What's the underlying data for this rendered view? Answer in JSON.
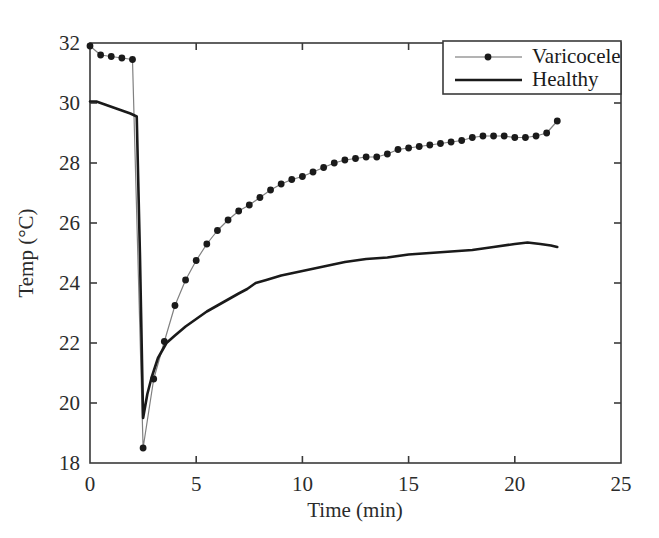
{
  "chart_data": {
    "type": "line",
    "title": "",
    "xlabel": "Time (min)",
    "ylabel": "Temp (°C)",
    "xlim": [
      0,
      25
    ],
    "ylim": [
      18,
      32
    ],
    "xticks": [
      0,
      5,
      10,
      15,
      20,
      25
    ],
    "yticks": [
      18,
      20,
      22,
      24,
      26,
      28,
      30,
      32
    ],
    "xtick_labels": [
      "0",
      "5",
      "10",
      "15",
      "20",
      "25"
    ],
    "ytick_labels": [
      "18",
      "20",
      "22",
      "24",
      "26",
      "28",
      "30",
      "32"
    ],
    "grid": false,
    "legend_position": "top-right",
    "series": [
      {
        "name": "Varicocele",
        "marker": "filled-circle",
        "line_style": "thin-solid",
        "color": "#808080",
        "marker_color": "#1a1a1a",
        "x": [
          0.0,
          0.5,
          1.0,
          1.5,
          2.0,
          2.5,
          3.0,
          3.5,
          4.0,
          4.5,
          5.0,
          5.5,
          6.0,
          6.5,
          7.0,
          7.5,
          8.0,
          8.5,
          9.0,
          9.5,
          10.0,
          10.5,
          11.0,
          11.5,
          12.0,
          12.5,
          13.0,
          13.5,
          14.0,
          14.5,
          15.0,
          15.5,
          16.0,
          16.5,
          17.0,
          17.5,
          18.0,
          18.5,
          19.0,
          19.5,
          20.0,
          20.5,
          21.0,
          21.5,
          22.0
        ],
        "y": [
          31.9,
          31.6,
          31.55,
          31.5,
          31.45,
          18.5,
          20.8,
          22.05,
          23.25,
          24.1,
          24.75,
          25.3,
          25.75,
          26.1,
          26.4,
          26.6,
          26.85,
          27.1,
          27.3,
          27.45,
          27.55,
          27.7,
          27.85,
          28.0,
          28.1,
          28.15,
          28.2,
          28.2,
          28.3,
          28.45,
          28.5,
          28.55,
          28.6,
          28.65,
          28.7,
          28.75,
          28.85,
          28.9,
          28.9,
          28.9,
          28.85,
          28.85,
          28.9,
          29.0,
          29.4
        ]
      },
      {
        "name": "Healthy",
        "marker": "none",
        "line_style": "thick-solid",
        "color": "#1a1a1a",
        "x": [
          0.0,
          0.3,
          0.7,
          1.1,
          1.5,
          1.9,
          2.2,
          2.35,
          2.5,
          2.7,
          2.9,
          3.2,
          3.6,
          4.0,
          4.5,
          5.0,
          5.5,
          6.0,
          6.5,
          7.0,
          7.4,
          7.8,
          8.3,
          9.0,
          10.0,
          11.0,
          12.0,
          13.0,
          14.0,
          15.0,
          16.0,
          17.0,
          18.0,
          19.0,
          20.0,
          20.6,
          21.2,
          21.7,
          22.0
        ],
        "y": [
          30.05,
          30.05,
          29.95,
          29.85,
          29.75,
          29.65,
          29.55,
          25.0,
          19.5,
          20.3,
          20.85,
          21.5,
          22.0,
          22.25,
          22.55,
          22.8,
          23.05,
          23.25,
          23.45,
          23.65,
          23.8,
          24.0,
          24.1,
          24.25,
          24.4,
          24.55,
          24.7,
          24.8,
          24.85,
          24.95,
          25.0,
          25.05,
          25.1,
          25.2,
          25.3,
          25.35,
          25.3,
          25.25,
          25.2
        ]
      }
    ]
  },
  "legend": {
    "entries": [
      {
        "label": "Varicocele",
        "style": "marker-line"
      },
      {
        "label": "Healthy",
        "style": "plain-line"
      }
    ]
  },
  "axes": {
    "x_axis_label": "Time (min)",
    "y_axis_label": "Temp (°C)"
  },
  "colors": {
    "varicocele_line": "#808080",
    "varicocele_marker": "#1a1a1a",
    "healthy_line": "#1a1a1a",
    "axis": "#3a3a3a",
    "text": "#2b2b2b",
    "background": "#ffffff"
  }
}
